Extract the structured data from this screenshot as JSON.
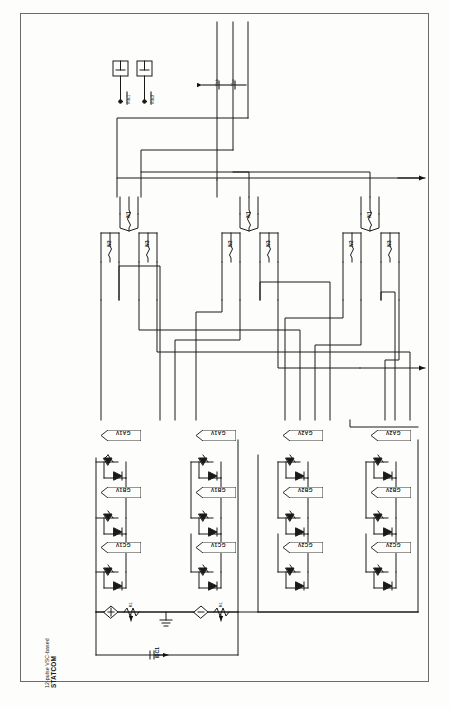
{
  "sheet": {
    "title_line1": "12-pulse VSC-based",
    "title_line2": "STATCOM"
  },
  "dc_sources": [
    {
      "name": "vdc1",
      "label": "Vdc1"
    },
    {
      "name": "vdc2",
      "label": "Vdc2"
    }
  ],
  "ac_bus": {
    "lines": [
      "a",
      "b",
      "c"
    ],
    "measurements": [
      {
        "name": "vab",
        "label": "Vab"
      },
      {
        "name": "vbc",
        "label": "Vbc"
      }
    ]
  },
  "transformers": [
    {
      "name": "transformer-phase-a",
      "primary": "N1",
      "secondaries": [
        "N2",
        "N3"
      ]
    },
    {
      "name": "transformer-phase-b",
      "primary": "N1",
      "secondaries": [
        "N2",
        "N3"
      ]
    },
    {
      "name": "transformer-phase-c",
      "primary": "N1",
      "secondaries": [
        "N2",
        "N3"
      ]
    }
  ],
  "converters": [
    {
      "name": "converter-leg-1",
      "valves": [
        {
          "gate": "GA1V"
        },
        {
          "gate": "GB1V"
        },
        {
          "gate": "GC1V"
        }
      ]
    },
    {
      "name": "converter-leg-2",
      "valves": [
        {
          "gate": "GA1V"
        },
        {
          "gate": "GB1V"
        },
        {
          "gate": "GC1V"
        }
      ]
    },
    {
      "name": "converter-leg-3",
      "valves": [
        {
          "gate": "GA2V"
        },
        {
          "gate": "GB2V"
        },
        {
          "gate": "GC2V"
        }
      ]
    },
    {
      "name": "converter-leg-4",
      "valves": [
        {
          "gate": "GA2V"
        },
        {
          "gate": "GB2V"
        },
        {
          "gate": "GC2V"
        }
      ]
    }
  ],
  "dc_circuit": {
    "sources": [
      {
        "name": "dc-source-1",
        "resistor": "R1"
      },
      {
        "name": "dc-source-2",
        "resistor": "R1"
      }
    ],
    "current_label": "IDC1",
    "ground": "gnd"
  },
  "outputs": [
    {
      "name": "output-upper",
      "label": ""
    },
    {
      "name": "output-lower",
      "label": ""
    }
  ],
  "colors": {
    "ink": "#1a1a1a",
    "frame": "#6b6b6b",
    "paper": "#fdfdfb"
  }
}
